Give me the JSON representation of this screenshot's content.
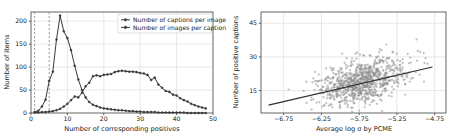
{
  "figure": {
    "panels": [
      "left-histogram",
      "right-scatter"
    ]
  },
  "chart_data": [
    {
      "type": "line",
      "panel": "left",
      "title": "",
      "xlabel": "Number of corresponding positives",
      "ylabel": "Number of items",
      "xlim": [
        0,
        50
      ],
      "ylim": [
        0,
        220
      ],
      "xticks": [
        0,
        10,
        20,
        30,
        40,
        50
      ],
      "xticklabels": [
        "0",
        "10",
        "20",
        "30",
        "40",
        "50"
      ],
      "yticks": [
        0,
        50,
        100,
        150,
        200
      ],
      "yticklabels": [
        "0",
        "50",
        "100",
        "150",
        "200"
      ],
      "grid": true,
      "legend_position": "upper right",
      "annotations": [
        {
          "kind": "vline",
          "x": 1,
          "style": "dashed",
          "color": "#8a8a8a"
        },
        {
          "kind": "vline",
          "x": 5,
          "style": "dashed",
          "color": "#8a8a8a"
        }
      ],
      "x": [
        1,
        2,
        3,
        4,
        5,
        6,
        7,
        8,
        9,
        10,
        11,
        12,
        13,
        14,
        15,
        16,
        17,
        18,
        19,
        20,
        21,
        22,
        23,
        24,
        25,
        26,
        27,
        28,
        29,
        30,
        31,
        32,
        33,
        34,
        35,
        36,
        37,
        38,
        39,
        40,
        41,
        42,
        43,
        44,
        45,
        46,
        47,
        48
      ],
      "series": [
        {
          "name": "Number of captions per image",
          "marker": "circle",
          "color": "#3a3a3a",
          "values": [
            2,
            5,
            14,
            29,
            70,
            90,
            160,
            212,
            178,
            163,
            137,
            103,
            73,
            50,
            34,
            24,
            18,
            15,
            12,
            10,
            9,
            8,
            7,
            6,
            6,
            5,
            4,
            4,
            3,
            3,
            2,
            2,
            2,
            2,
            1,
            1,
            1,
            1,
            1,
            1,
            1,
            1,
            0,
            0,
            0,
            0,
            0,
            0
          ]
        },
        {
          "name": "Number of images per caption",
          "marker": "circle",
          "color": "#3a3a3a",
          "values": [
            1,
            1,
            2,
            2,
            3,
            4,
            6,
            9,
            14,
            20,
            28,
            36,
            34,
            44,
            58,
            66,
            80,
            82,
            80,
            83,
            84,
            85,
            89,
            91,
            92,
            91,
            90,
            90,
            89,
            87,
            86,
            83,
            72,
            77,
            62,
            55,
            48,
            46,
            40,
            38,
            32,
            28,
            25,
            20,
            17,
            14,
            12,
            10
          ]
        }
      ],
      "series2_x": [
        1,
        2,
        3,
        4,
        5,
        6,
        7,
        8,
        9,
        10,
        11,
        12,
        13,
        14,
        15,
        16,
        17,
        18,
        19,
        20,
        21,
        22,
        23,
        24,
        25,
        26,
        27,
        28,
        29,
        30,
        31,
        32,
        33,
        34,
        35,
        36,
        37,
        38,
        39,
        40,
        41,
        42,
        43,
        44,
        45,
        46,
        47,
        48
      ],
      "series2_tail_note": "broad plateau near 90 between x=15 and x=27, decaying to near 0 by x=48"
    },
    {
      "type": "scatter",
      "panel": "right",
      "title": "",
      "xlabel": "Average log σ by PCME",
      "ylabel": "Number of positive captions",
      "xlim": [
        -7.05,
        -4.6
      ],
      "ylim": [
        5,
        50
      ],
      "xticks": [
        -6.75,
        -6.25,
        -5.75,
        -5.25,
        -4.75
      ],
      "xticklabels": [
        "−6.75",
        "−6.25",
        "−5.75",
        "−5.25",
        "−4.75"
      ],
      "yticks": [
        15,
        30,
        45
      ],
      "yticklabels": [
        "15",
        "30",
        "45"
      ],
      "grid": true,
      "point_color": "#8e8e8e",
      "point_alpha": 0.55,
      "trendline": {
        "x0": -6.95,
        "y0": 8.5,
        "x1": -4.78,
        "y1": 25.5,
        "color": "#2e2e2e"
      },
      "n_points": 900,
      "cluster_center": [
        -5.72,
        19.0
      ],
      "spread": [
        0.3,
        5.2
      ]
    }
  ]
}
